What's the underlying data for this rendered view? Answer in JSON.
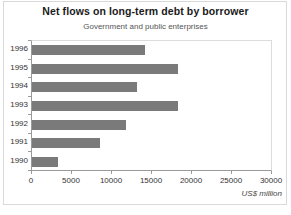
{
  "chart_data": {
    "type": "bar",
    "orientation": "horizontal",
    "title": "Net flows on long-term debt by borrower",
    "subtitle": "Government and public enterprises",
    "xlabel": "US$ million",
    "ylabel": "",
    "categories": [
      "1990",
      "1991",
      "1992",
      "1993",
      "1994",
      "1995",
      "1996"
    ],
    "values": [
      3200,
      8500,
      11700,
      18300,
      13100,
      18200,
      14100
    ],
    "series": [
      {
        "name": "Government and public enterprises",
        "values": [
          3200,
          8500,
          11700,
          18300,
          13100,
          18200,
          14100
        ]
      }
    ],
    "xlim": [
      0,
      30000
    ],
    "xticks": [
      0,
      5000,
      10000,
      15000,
      20000,
      25000,
      30000
    ],
    "xtick_labels": [
      "0",
      "5000",
      "10000",
      "15000",
      "20000",
      "25000",
      "30000"
    ],
    "grid": false,
    "legend": false,
    "bar_color": "#7a7a7a",
    "axis_color": "#9a9a9a",
    "frame_color": "#d9d9d9"
  }
}
